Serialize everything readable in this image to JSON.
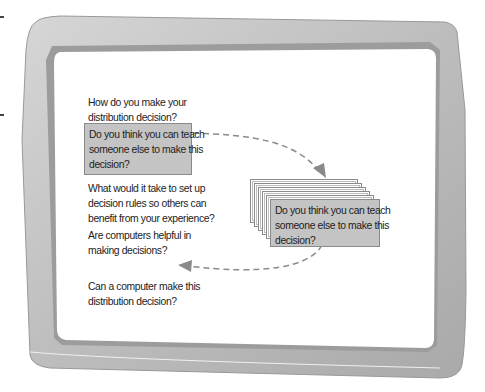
{
  "screen": {
    "questions": [
      {
        "id": "q1",
        "text": "How do you make your\ndistribution decision?",
        "highlighted": false
      },
      {
        "id": "q2",
        "text": "Do you think you can teach\nsomeone else to make this\ndecision?",
        "highlighted": true
      },
      {
        "id": "q3",
        "text": "What would it take to set up\ndecision rules so others can\nbenefit from your experience?",
        "highlighted": false
      },
      {
        "id": "q4",
        "text": "Are computers helpful in\nmaking decisions?",
        "highlighted": false
      },
      {
        "id": "q5",
        "text": "Can a computer make this\ndistribution decision?",
        "highlighted": false
      }
    ],
    "stacked_card": {
      "text": "Do you think you can teach\nsomeone else to make this\ndecision?",
      "stack_count": 6
    }
  },
  "colors": {
    "frame": "#b9b9b9",
    "frame_dark": "#8f8f8f",
    "highlight_box": "#c4c4c4",
    "arrow": "#8a8a8a"
  }
}
